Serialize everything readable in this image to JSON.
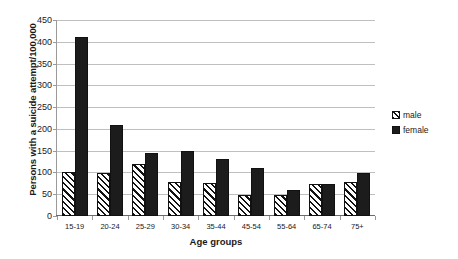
{
  "chart_data": {
    "type": "bar",
    "title": "",
    "subtitle": "",
    "xlabel": "Age groups",
    "ylabel": "Persons with a suicide attempt/100,000",
    "categories": [
      "15-19",
      "20-24",
      "25-29",
      "30-34",
      "35-44",
      "45-54",
      "55-64",
      "65-74",
      "75+"
    ],
    "series": [
      {
        "name": "male",
        "values": [
          100,
          99,
          120,
          79,
          75,
          49,
          48,
          73,
          78
        ],
        "color": "#ffffff",
        "pattern": "diagonal-hatch"
      },
      {
        "name": "female",
        "values": [
          411,
          210,
          144,
          150,
          130,
          110,
          60,
          74,
          99
        ],
        "color": "#1c1c1c",
        "pattern": "solid"
      }
    ],
    "ylim": [
      0,
      450
    ],
    "ytick_values": [
      0,
      50,
      100,
      150,
      200,
      250,
      300,
      350,
      400,
      450
    ],
    "ytick_labels": [
      "0",
      "50",
      "100",
      "150",
      "200",
      "250",
      "300",
      "350",
      "400",
      "450"
    ],
    "grid": true,
    "grid_axis": "y",
    "legend_position": "right",
    "legend_entries": [
      "male",
      "female"
    ]
  },
  "axes": {
    "y_title": "Persons with a suicide attempt/100,000",
    "x_title": "Age groups"
  },
  "legend": {
    "items": [
      {
        "label": "male",
        "swatch": "hatched-square-icon"
      },
      {
        "label": "female",
        "swatch": "filled-square-icon"
      }
    ]
  }
}
